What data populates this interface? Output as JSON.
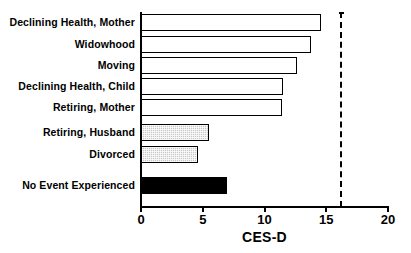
{
  "chart_data": {
    "type": "bar",
    "orientation": "horizontal",
    "title": "",
    "subtitle": "",
    "xlabel": "CES-D",
    "ylabel": "",
    "xlim": [
      0,
      20
    ],
    "xticks": [
      0,
      5,
      10,
      15,
      20
    ],
    "xtick_labels": [
      "0",
      "5",
      "10",
      "15",
      "20"
    ],
    "grid": false,
    "legend": "none",
    "categories": [
      "Declining Health, Mother",
      "Widowhood",
      "Moving",
      "Declining Health, Child",
      "Retiring, Mother",
      "Retiring, Husband",
      "Divorced",
      "No Event Experienced"
    ],
    "values": [
      14.6,
      13.8,
      12.6,
      11.5,
      11.4,
      5.5,
      4.6,
      7.0
    ],
    "bar_styles": [
      "open",
      "open",
      "open",
      "open",
      "open",
      "gray",
      "gray",
      "solid"
    ],
    "annotations": [
      {
        "type": "reference-line",
        "style": "dashed",
        "x": 16.1,
        "label": ""
      }
    ],
    "colors": {
      "open_fill": "#ffffff",
      "gray_fill": "#c8c8c8",
      "solid_fill": "#000000",
      "outline": "#000000",
      "axis": "#000000",
      "background": "#ffffff"
    }
  },
  "bars": [
    {
      "label": "Declining Health, Mother",
      "value": 14.6,
      "style": "open"
    },
    {
      "label": "Widowhood",
      "value": 13.8,
      "style": "open"
    },
    {
      "label": "Moving",
      "value": 12.6,
      "style": "open"
    },
    {
      "label": "Declining Health, Child",
      "value": 11.5,
      "style": "open"
    },
    {
      "label": "Retiring, Mother",
      "value": 11.4,
      "style": "open"
    },
    {
      "label": "Retiring, Husband",
      "value": 5.5,
      "style": "gray"
    },
    {
      "label": "Divorced",
      "value": 4.6,
      "style": "gray"
    },
    {
      "label": "No Event Experienced",
      "value": 7.0,
      "style": "solid"
    }
  ],
  "axis": {
    "title": "CES-D",
    "ticks": [
      "0",
      "5",
      "10",
      "15",
      "20"
    ]
  }
}
